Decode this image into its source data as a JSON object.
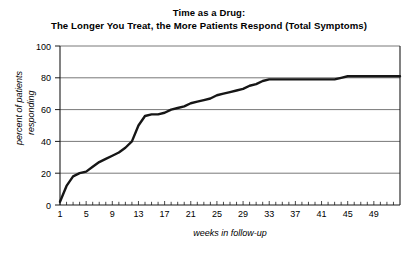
{
  "chart_data": {
    "type": "line",
    "title": "Time as a Drug:",
    "subtitle": "The Longer You Treat, the More Patients Respond (Total Symptoms)",
    "xlabel": "weeks in follow-up",
    "ylabel_line1": "percent of patients",
    "ylabel_line2": "responding",
    "xlim": [
      1,
      53
    ],
    "ylim": [
      0,
      100
    ],
    "xticks": [
      1,
      5,
      9,
      13,
      17,
      21,
      25,
      29,
      33,
      37,
      41,
      45,
      49
    ],
    "xtick_labels": [
      "1",
      "5",
      "9",
      "13",
      "17",
      "21",
      "25",
      "29",
      "33",
      "37",
      "41",
      "45",
      "49"
    ],
    "minor_xtick_step": 1,
    "yticks": [
      0,
      20,
      40,
      60,
      80,
      100
    ],
    "ytick_labels": [
      "0",
      "20",
      "40",
      "60",
      "80",
      "100"
    ],
    "grid": "horizontal",
    "legend": "none",
    "line_color": "#161616",
    "grid_color": "#555555",
    "background_color": "#ffffff",
    "series": [
      {
        "name": "percent of patients responding",
        "x": [
          1,
          2,
          3,
          4,
          5,
          6,
          7,
          8,
          9,
          10,
          11,
          12,
          13,
          14,
          15,
          16,
          17,
          18,
          19,
          20,
          21,
          22,
          23,
          24,
          25,
          26,
          27,
          28,
          29,
          30,
          31,
          32,
          33,
          34,
          35,
          36,
          37,
          38,
          39,
          40,
          41,
          42,
          43,
          44,
          45,
          46,
          47,
          48,
          49,
          50,
          51,
          52,
          53
        ],
        "values": [
          2,
          12,
          18,
          20,
          21,
          24,
          27,
          29,
          31,
          33,
          36,
          40,
          50,
          56,
          57,
          57,
          58,
          60,
          61,
          62,
          64,
          65,
          66,
          67,
          69,
          70,
          71,
          72,
          73,
          75,
          76,
          78,
          79,
          79,
          79,
          79,
          79,
          79,
          79,
          79,
          79,
          79,
          79,
          80,
          81,
          81,
          81,
          81,
          81,
          81,
          81,
          81,
          81
        ]
      }
    ]
  }
}
